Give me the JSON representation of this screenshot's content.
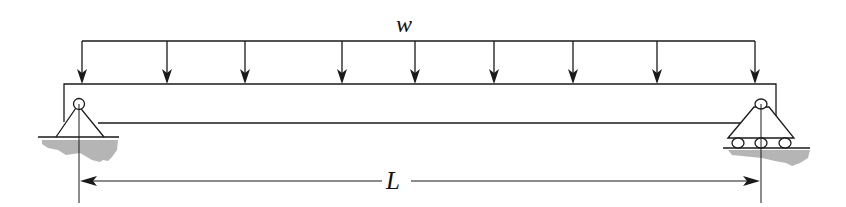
{
  "diagram": {
    "type": "simply-supported beam with uniformly distributed load",
    "load_label": "w",
    "span_label": "L",
    "colors": {
      "line": "#1a1a1a",
      "ground": "#b5b5b5",
      "background": "#ffffff"
    },
    "load_arrow_x": [
      82,
      167,
      245,
      342,
      415,
      494,
      573,
      657,
      755
    ],
    "supports": [
      {
        "side": "left",
        "kind": "pin",
        "x": 78
      },
      {
        "side": "right",
        "kind": "roller",
        "x": 761
      }
    ]
  }
}
